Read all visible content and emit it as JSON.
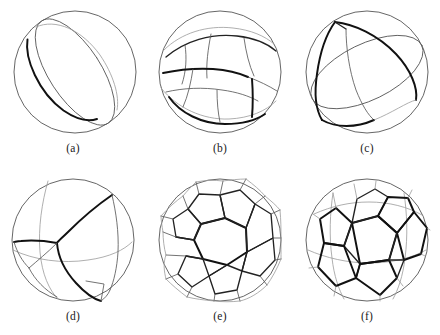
{
  "figure": {
    "background_color": "#ffffff",
    "width": 440,
    "height": 335,
    "rows": 2,
    "columns": 3,
    "stroke_colors": {
      "outline": "#4a4a4a",
      "thin": "#5a5a5a",
      "faint": "#9a9a9a",
      "thick": "#111111"
    }
  },
  "panels": [
    {
      "id": "a",
      "caption": "(a)",
      "position": {
        "left": 0,
        "top": 0
      },
      "title": "two-cell partition by a great circle"
    },
    {
      "id": "b",
      "caption": "(b)",
      "position": {
        "left": 147,
        "top": 0
      },
      "title": "multi-cell band partition"
    },
    {
      "id": "c",
      "caption": "(c)",
      "position": {
        "left": 294,
        "top": 0
      },
      "title": "three-cell partition"
    },
    {
      "id": "d",
      "caption": "(d)",
      "position": {
        "left": 0,
        "top": 168
      },
      "title": "four-cell partition"
    },
    {
      "id": "e",
      "caption": "(e)",
      "position": {
        "left": 147,
        "top": 168
      },
      "title": "truncated icosahedral partition"
    },
    {
      "id": "f",
      "caption": "(f)",
      "position": {
        "left": 294,
        "top": 168
      },
      "title": "dodecahedral partition"
    }
  ]
}
